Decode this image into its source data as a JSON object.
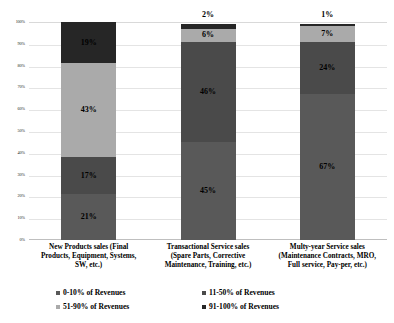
{
  "chart_data": {
    "type": "bar",
    "variant": "stacked-100-percent",
    "title": "",
    "xlabel": "",
    "ylabel": "",
    "ylim": [
      0,
      100
    ],
    "grid": true,
    "legend_position": "bottom",
    "categories": [
      "New Products sales (Final Products, Equipment, Systems, SW, etc.)",
      "Transactional Service sales (Spare Parts, Corrective Maintenance, Training, etc.)",
      "Multy-year Service sales (Maintenance Contracts, MRO, Full service, Pay-per, etc.)"
    ],
    "category_lines": [
      [
        "New Products sales (Final",
        "Products, Equipment, Systems,",
        "SW, etc.)"
      ],
      [
        "Transactional Service sales",
        "(Spare Parts, Corrective",
        "Maintenance, Training, etc.)"
      ],
      [
        "Multy-year Service sales",
        "(Maintenance Contracts, MRO,",
        "Full service, Pay-per, etc.)"
      ]
    ],
    "series": [
      {
        "name": "0-10% of Revenues",
        "color": "#595959",
        "values": [
          21,
          45,
          67
        ],
        "labels": [
          "21%",
          "45%",
          "67%"
        ]
      },
      {
        "name": "11-50% of Revenues",
        "color": "#4a4a4a",
        "values": [
          17,
          46,
          24
        ],
        "labels": [
          "17%",
          "46%",
          "24%"
        ]
      },
      {
        "name": "51-90% of Revenues",
        "color": "#aaaaaa",
        "values": [
          43,
          6,
          7
        ],
        "labels": [
          "43%",
          "6%",
          "7%"
        ]
      },
      {
        "name": "91-100% of Revenues",
        "color": "#262626",
        "values": [
          19,
          2,
          1
        ],
        "labels": [
          "19%",
          "2%",
          "1%"
        ]
      }
    ],
    "y_ticks": [
      "0%",
      "10%",
      "20%",
      "30%",
      "40%",
      "50%",
      "60%",
      "70%",
      "80%",
      "90%",
      "100%"
    ],
    "outside_labels": [
      {
        "category_index": 1,
        "text": "2%"
      },
      {
        "category_index": 2,
        "text": "1%"
      }
    ]
  },
  "legend": {
    "items": [
      {
        "label": "0-10% of Revenues",
        "color": "#595959"
      },
      {
        "label": "11-50% of Revenues",
        "color": "#4a4a4a"
      },
      {
        "label": "51-90% of Revenues",
        "color": "#aaaaaa"
      },
      {
        "label": "91-100% of Revenues",
        "color": "#262626"
      }
    ]
  }
}
